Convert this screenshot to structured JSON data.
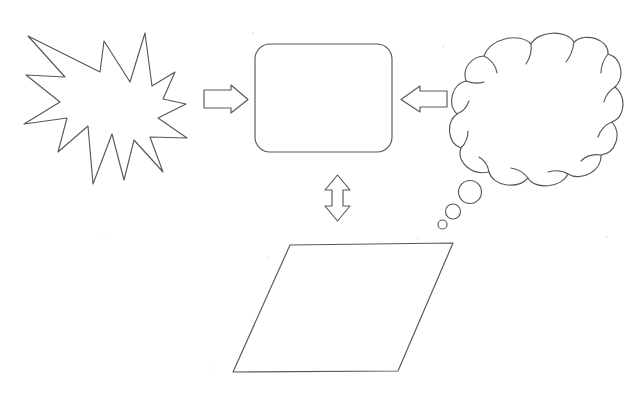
{
  "document": {
    "title": "Hand-drawn flowchart shapes diagram",
    "background_color": "#ffffff",
    "stroke_color": "#58585a",
    "fill_color": "#ffffff",
    "width": 638,
    "height": 399
  },
  "shapes": {
    "starburst": {
      "label": "starburst-explosion-shape",
      "description": "Jagged 12-point explosion / starburst outline",
      "bounds": {
        "x": 22,
        "y": 33,
        "width": 165,
        "height": 152
      },
      "points": "28,36 100,72 104,41 130,82 145,33 152,86 175,72 163,99 186,104 158,118 187,138 150,137 163,172 134,140 124,180 112,134 93,184 88,126 58,152 67,118 24,124 60,102 26,75 65,77"
    },
    "rounded_rectangle": {
      "label": "rounded-rectangle-shape",
      "description": "Empty rounded rectangle / process box",
      "bounds": {
        "x": 255,
        "y": 44,
        "width": 137,
        "height": 108
      },
      "corner_radius": 15
    },
    "thought_cloud": {
      "label": "thought-cloud-shape",
      "description": "Thought bubble cloud with three trailing bubbles",
      "bounds": {
        "x": 448,
        "y": 36,
        "width": 174,
        "height": 152
      },
      "trailing_bubbles": [
        {
          "cx": 470,
          "cy": 192,
          "r": 11.5
        },
        {
          "cx": 453,
          "cy": 211.5,
          "r": 7.5
        },
        {
          "cx": 442.5,
          "cy": 224.5,
          "r": 4.5
        }
      ]
    },
    "parallelogram": {
      "label": "parallelogram-shape",
      "description": "Empty parallelogram / data shape",
      "points": "290,245 453,243 398,371 233,372"
    }
  },
  "arrows": {
    "left_arrow": {
      "label": "right-pointing-block-arrow",
      "direction": "right",
      "from": "starburst",
      "to": "rounded_rectangle",
      "points": "204,90 231,90 231,85 248,99.5 231,113 231,108 204,108"
    },
    "right_arrow": {
      "label": "left-pointing-block-arrow",
      "direction": "left",
      "from": "thought_cloud",
      "to": "rounded_rectangle",
      "points": "447,91 420,91 420,86 401,99.5 420,112 420,107 447,107"
    },
    "bottom_arrow": {
      "label": "vertical-double-headed-block-arrow",
      "direction": "up-down",
      "from": "rounded_rectangle",
      "to": "parallelogram",
      "points": "337.5,175 350,190 343,190 343,206 350,206 337.5,221 325,206 332,206 332,190 325,190"
    }
  },
  "annotations": {
    "alt_text": "Diagram of four blank flowchart shapes connected by arrows: an explosion burst points right to a rounded rectangle, a thought cloud points left to the same rounded rectangle, and a vertical double arrow links the rounded rectangle with a parallelogram below."
  }
}
